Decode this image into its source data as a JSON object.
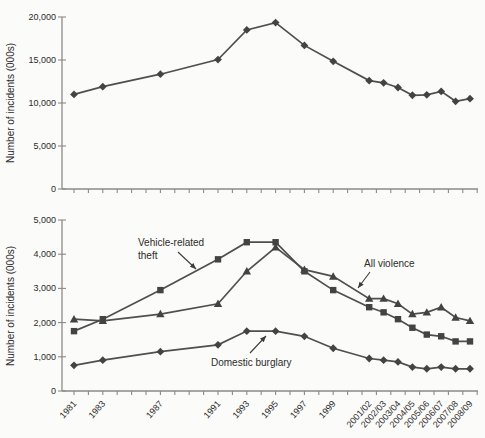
{
  "figure": {
    "background": "#fbfbf9",
    "line_color": "#4f4f4f",
    "marker_color": "#434343",
    "axis_color": "#8a8a8a",
    "text_color": "#2b2b2b"
  },
  "x_axis": {
    "tick_labels": [
      "1981",
      "1983",
      "1987",
      "1991",
      "1993",
      "1995",
      "1997",
      "1999",
      "2001/02",
      "2002/03",
      "2003/04",
      "2004/05",
      "2005/06",
      "2006/07",
      "2007/08",
      "2008/09"
    ]
  },
  "chart_data": [
    {
      "type": "line",
      "title": "",
      "xlabel": "",
      "ylabel": "Number of incidents (000s)",
      "ylim": [
        0,
        20000
      ],
      "yticks": [
        0,
        5000,
        10000,
        15000,
        20000
      ],
      "ytick_labels": [
        "0",
        "5,000",
        "10,000",
        "15,000",
        "20,000"
      ],
      "grid": false,
      "legend_position": "none",
      "categories": [
        "1981",
        "1983",
        "1987",
        "1991",
        "1993",
        "1995",
        "1997",
        "1999",
        "2001/02",
        "2002/03",
        "2003/04",
        "2004/05",
        "2005/06",
        "2006/07",
        "2007/08",
        "2008/09"
      ],
      "x_numeric": [
        1981,
        1983,
        1987,
        1991,
        1993,
        1995,
        1997,
        1999,
        2001.5,
        2002.5,
        2003.5,
        2004.5,
        2005.5,
        2006.5,
        2007.5,
        2008.5
      ],
      "series": [
        {
          "marker": "diamond",
          "values": [
            11000,
            11900,
            13350,
            15050,
            18500,
            19350,
            16700,
            14850,
            12600,
            12350,
            11800,
            10900,
            10950,
            11350,
            10200,
            10500
          ]
        }
      ]
    },
    {
      "type": "line",
      "title": "",
      "xlabel": "",
      "ylabel": "Number of incidents (000s)",
      "ylim": [
        0,
        5000
      ],
      "yticks": [
        0,
        1000,
        2000,
        3000,
        4000,
        5000
      ],
      "ytick_labels": [
        "0",
        "1,000",
        "2,000",
        "3,000",
        "4,000",
        "5,000"
      ],
      "grid": false,
      "legend_position": "inline-annotations",
      "categories": [
        "1981",
        "1983",
        "1987",
        "1991",
        "1993",
        "1995",
        "1997",
        "1999",
        "2001/02",
        "2002/03",
        "2003/04",
        "2004/05",
        "2005/06",
        "2006/07",
        "2007/08",
        "2008/09"
      ],
      "x_numeric": [
        1981,
        1983,
        1987,
        1991,
        1993,
        1995,
        1997,
        1999,
        2001.5,
        2002.5,
        2003.5,
        2004.5,
        2005.5,
        2006.5,
        2007.5,
        2008.5
      ],
      "series": [
        {
          "name": "Vehicle-related theft",
          "marker": "square",
          "values": [
            1750,
            2100,
            2950,
            3850,
            4350,
            4350,
            3500,
            2950,
            2450,
            2300,
            2100,
            1850,
            1650,
            1600,
            1450,
            1450
          ]
        },
        {
          "name": "All violence",
          "marker": "triangle",
          "values": [
            2100,
            2050,
            2250,
            2550,
            3500,
            4200,
            3550,
            3350,
            2700,
            2700,
            2550,
            2250,
            2300,
            2450,
            2150,
            2050
          ]
        },
        {
          "name": "Domestic burglary",
          "marker": "diamond",
          "values": [
            750,
            900,
            1150,
            1350,
            1750,
            1750,
            1600,
            1250,
            950,
            900,
            850,
            700,
            650,
            700,
            650,
            650
          ]
        }
      ],
      "annotations": [
        {
          "text": "Vehicle-related theft",
          "lines": [
            "Vehicle-related",
            "theft"
          ]
        },
        {
          "text": "All violence",
          "lines": [
            "All violence"
          ]
        },
        {
          "text": "Domestic burglary",
          "lines": [
            "Domestic burglary"
          ]
        }
      ]
    }
  ]
}
